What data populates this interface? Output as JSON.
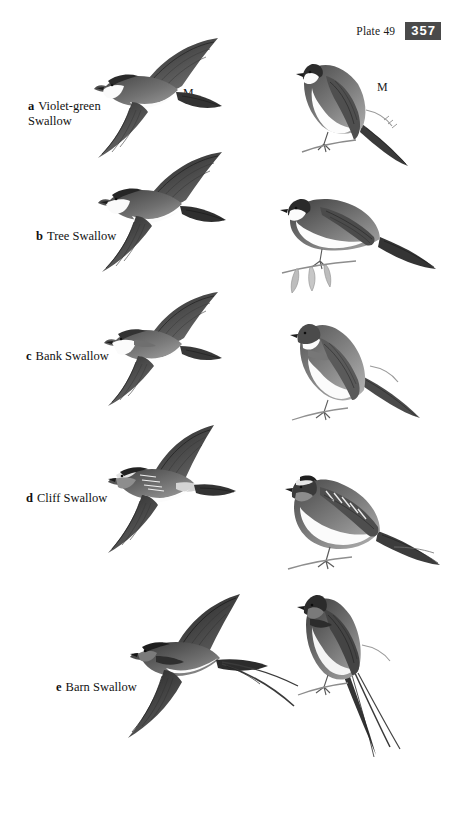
{
  "page": {
    "background_color": "#ffffff",
    "width": 463,
    "height": 816
  },
  "header": {
    "plate_label": "Plate 49",
    "page_number": "357",
    "page_number_box_color": "#4a4a4a",
    "page_number_text_color": "#ffffff"
  },
  "species": [
    {
      "letter": "a",
      "name": "Violet-green\nSwallow",
      "flight_annotation": "M",
      "perched_annotation": "M"
    },
    {
      "letter": "b",
      "name": "Tree Swallow",
      "flight_annotation": "",
      "perched_annotation": ""
    },
    {
      "letter": "c",
      "name": "Bank Swallow",
      "flight_annotation": "",
      "perched_annotation": ""
    },
    {
      "letter": "d",
      "name": "Cliff Swallow",
      "flight_annotation": "",
      "perched_annotation": ""
    },
    {
      "letter": "e",
      "name": "Barn Swallow",
      "flight_annotation": "",
      "perched_annotation": ""
    }
  ],
  "illustration_style": {
    "medium": "grayscale pen-and-ink field guide plate",
    "ink_dark": "#2b2b2b",
    "ink_mid": "#6e6e6e",
    "ink_light": "#b8b8b8",
    "belly_white": "#f7f7f7",
    "columns": [
      "flight",
      "perched"
    ]
  }
}
